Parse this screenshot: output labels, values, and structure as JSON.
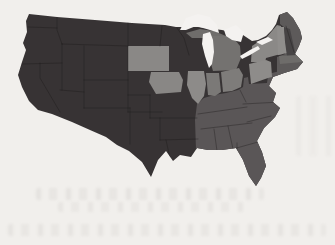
{
  "map": {
    "kind": "us-states-choropleth-scan",
    "shade_levels": [
      "dark",
      "medium",
      "medium_light",
      "light"
    ],
    "categories": {
      "WA": "dark",
      "OR": "dark",
      "CA": "dark",
      "ID": "dark",
      "NV": "dark",
      "UT": "dark",
      "AZ": "dark",
      "MT": "dark",
      "WY": "dark",
      "CO": "dark",
      "NM": "dark",
      "ND": "dark",
      "NE": "dark",
      "KS": "dark",
      "OK": "dark",
      "TX": "dark",
      "MN": "dark",
      "WI": "dark",
      "MO": "dark",
      "AR": "dark",
      "LA": "dark",
      "NH": "dark",
      "SD": "light",
      "IA": "light",
      "IL": "light",
      "NY": "light",
      "PA": "light",
      "VT": "light",
      "IN": "medium_light",
      "OH": "medium_light",
      "MI": "medium_light",
      "MA": "medium_light",
      "ME": "medium",
      "CT": "medium",
      "RI": "medium",
      "NJ": "medium",
      "DE": "medium",
      "MD": "medium",
      "WV": "medium",
      "VA": "medium",
      "KY": "medium",
      "TN": "medium",
      "NC": "medium",
      "SC": "medium",
      "GA": "medium",
      "AL": "medium",
      "MS": "medium",
      "FL": "medium"
    },
    "fills": {
      "base_dark": "#373334",
      "southeast_medium": "#5a5657",
      "newengland_medium": "#5d5a5a",
      "michigan_lower": "#747270",
      "michigan_upper": "#6f6d6b",
      "indiana": "#7b7977",
      "ohio": "#7e7c7a",
      "illinois": "#8d8b89",
      "iowa": "#898785",
      "south_dakota": "#8a8886",
      "new_york": "#8b8987",
      "pennsylvania": "#8e8c8a",
      "vermont": "#908e8c",
      "new_hampshire": "#474445",
      "massachusetts": "#6e6c6a",
      "border_line": "#191617",
      "water": "#f4f2f0",
      "paper_background": "#f1efec"
    }
  }
}
